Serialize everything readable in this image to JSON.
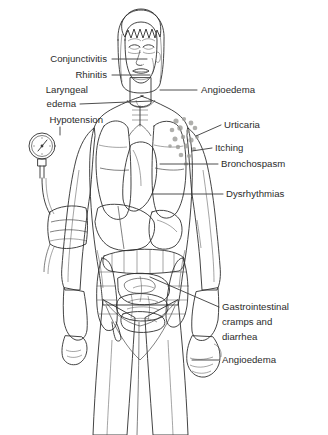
{
  "illustration": {
    "title": "Signs and symptoms of anaphylaxis",
    "subject": "female human figure, anterior view, showing internal organs",
    "background_color": "#ffffff",
    "line_color": "#2f2f2f",
    "text_color": "#2b2b2b"
  },
  "palette": {
    "skin": "#e2e0dc",
    "skin_shadow": "#c9c7c2",
    "skin_deep_shadow": "#b2b0ab",
    "hair_dark": "#4a4a4a",
    "hair_mid": "#6e6e6e",
    "hair_light": "#9a9a9a",
    "lung": "#8e8e8e",
    "heart": "#6a6a6a",
    "liver": "#7c7c7c",
    "stomach": "#949494",
    "intestine": "#b8b8b4",
    "colon": "#aaaaa6",
    "cuff": "#a8a6a2",
    "gauge_face": "#eeeeec",
    "urticaria_spot": "#9b9b97"
  },
  "labels_left": [
    {
      "id": "conjunctivitis",
      "text": "Conjunctivitis",
      "x": 107,
      "y": 62,
      "line": {
        "x1": 112,
        "y1": 59,
        "x2": 147,
        "y2": 59
      }
    },
    {
      "id": "rhinitis",
      "text": "Rhinitis",
      "x": 107,
      "y": 78,
      "line": {
        "x1": 112,
        "y1": 75,
        "x2": 150,
        "y2": 75
      }
    },
    {
      "id": "laryngeal-edema-line1",
      "text": "Laryngeal",
      "x": 88,
      "y": 93,
      "line": null
    },
    {
      "id": "laryngeal-edema-line2",
      "text": "edema",
      "x": 76,
      "y": 107,
      "line": {
        "x1": 80,
        "y1": 104,
        "x2": 152,
        "y2": 101
      }
    },
    {
      "id": "hypotension",
      "text": "Hypotension",
      "x": 103,
      "y": 123,
      "line": {
        "x1": 60,
        "y1": 127,
        "x2": 60,
        "y2": 135
      }
    }
  ],
  "labels_right": [
    {
      "id": "angioedema-face",
      "text": "Angioedema",
      "x": 201,
      "y": 93,
      "line": {
        "x1": 160,
        "y1": 90,
        "x2": 197,
        "y2": 90
      }
    },
    {
      "id": "urticaria",
      "text": "Urticaria",
      "x": 224,
      "y": 128,
      "line": {
        "x1": 196,
        "y1": 136,
        "x2": 221,
        "y2": 125
      }
    },
    {
      "id": "itching",
      "text": "Itching",
      "x": 215,
      "y": 151,
      "line": {
        "x1": 192,
        "y1": 151,
        "x2": 212,
        "y2": 148
      }
    },
    {
      "id": "bronchospasm",
      "text": "Bronchospasm",
      "x": 221,
      "y": 167,
      "line": {
        "x1": 160,
        "y1": 164,
        "x2": 218,
        "y2": 164
      }
    },
    {
      "id": "dysrhythmias",
      "text": "Dysrhythmias",
      "x": 226,
      "y": 197,
      "line": {
        "x1": 152,
        "y1": 194,
        "x2": 223,
        "y2": 194
      }
    },
    {
      "id": "gi-cramps-line1",
      "text": "Gastrointestinal",
      "x": 222,
      "y": 310,
      "line": {
        "x1": 150,
        "y1": 277,
        "x2": 219,
        "y2": 307
      }
    },
    {
      "id": "gi-cramps-line2",
      "text": "cramps and",
      "x": 222,
      "y": 325,
      "line": null
    },
    {
      "id": "gi-cramps-line3",
      "text": "diarrhea",
      "x": 222,
      "y": 340,
      "line": null
    },
    {
      "id": "angioedema-hand",
      "text": "Angioedema",
      "x": 222,
      "y": 363,
      "line": {
        "x1": 192,
        "y1": 360,
        "x2": 219,
        "y2": 360
      }
    }
  ],
  "anatomy_regions": [
    {
      "id": "head",
      "name": "head"
    },
    {
      "id": "hair",
      "name": "hair-bob-with-bangs"
    },
    {
      "id": "eyes",
      "name": "closed-swollen-eyes"
    },
    {
      "id": "nose",
      "name": "nose"
    },
    {
      "id": "mouth",
      "name": "mouth"
    },
    {
      "id": "neck",
      "name": "neck"
    },
    {
      "id": "torso",
      "name": "torso"
    },
    {
      "id": "lung-right",
      "name": "right-lung"
    },
    {
      "id": "lung-left",
      "name": "left-lung"
    },
    {
      "id": "heart",
      "name": "heart"
    },
    {
      "id": "liver",
      "name": "liver"
    },
    {
      "id": "stomach",
      "name": "stomach"
    },
    {
      "id": "transverse-colon",
      "name": "transverse-colon"
    },
    {
      "id": "small-intestine",
      "name": "small-intestine"
    },
    {
      "id": "ascending-colon",
      "name": "ascending-colon"
    },
    {
      "id": "descending-colon",
      "name": "descending-colon"
    },
    {
      "id": "arm-left",
      "name": "figure-left-arm"
    },
    {
      "id": "arm-right",
      "name": "figure-right-arm"
    },
    {
      "id": "hand-right",
      "name": "swollen-right-hand"
    },
    {
      "id": "legs",
      "name": "legs"
    },
    {
      "id": "urticaria-spots",
      "name": "urticaria-hives-on-shoulder"
    },
    {
      "id": "bp-cuff",
      "name": "blood-pressure-cuff"
    },
    {
      "id": "bp-gauge",
      "name": "blood-pressure-gauge"
    },
    {
      "id": "bp-tubing",
      "name": "blood-pressure-tubing"
    }
  ],
  "urticaria_spots": [
    {
      "cx": 176,
      "cy": 121,
      "r": 2.6
    },
    {
      "cx": 184,
      "cy": 119,
      "r": 2.1
    },
    {
      "cx": 191,
      "cy": 123,
      "r": 2.4
    },
    {
      "cx": 172,
      "cy": 130,
      "r": 2.3
    },
    {
      "cx": 180,
      "cy": 128,
      "r": 2.7
    },
    {
      "cx": 188,
      "cy": 131,
      "r": 2.0
    },
    {
      "cx": 195,
      "cy": 128,
      "r": 2.3
    },
    {
      "cx": 175,
      "cy": 139,
      "r": 2.5
    },
    {
      "cx": 183,
      "cy": 137,
      "r": 2.2
    },
    {
      "cx": 191,
      "cy": 140,
      "r": 2.6
    },
    {
      "cx": 178,
      "cy": 147,
      "r": 2.2
    },
    {
      "cx": 186,
      "cy": 146,
      "r": 2.4
    },
    {
      "cx": 194,
      "cy": 149,
      "r": 2.0
    },
    {
      "cx": 181,
      "cy": 155,
      "r": 2.3
    },
    {
      "cx": 189,
      "cy": 156,
      "r": 2.1
    },
    {
      "cx": 197,
      "cy": 137,
      "r": 1.9
    },
    {
      "cx": 170,
      "cy": 146,
      "r": 1.8
    },
    {
      "cx": 186,
      "cy": 164,
      "r": 2.0
    }
  ]
}
